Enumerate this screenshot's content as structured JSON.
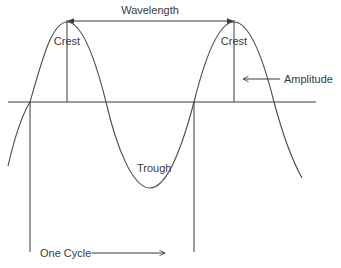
{
  "diagram": {
    "labels": {
      "wavelength": "Wavelength",
      "crest_left": "Crest",
      "crest_right": "Crest",
      "amplitude": "Amplitude",
      "trough": "Trough",
      "one_cycle": "One Cycle"
    },
    "colors": {
      "line": "#3a3a3a",
      "text": "#3a3a3a",
      "background": "#ffffff"
    }
  }
}
